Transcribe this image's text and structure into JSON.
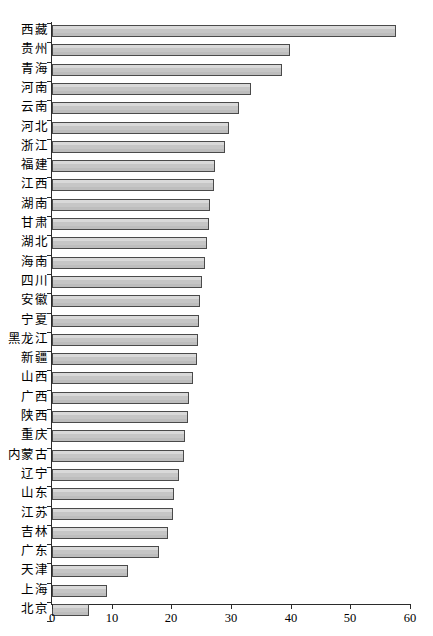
{
  "chart_data": {
    "type": "bar",
    "orientation": "horizontal",
    "title": "",
    "subtitle": "",
    "xlabel": "",
    "ylabel": "",
    "xlim": [
      0,
      60
    ],
    "ylim": null,
    "grid": false,
    "legend": null,
    "xticks": [
      0,
      10,
      20,
      30,
      40,
      50,
      60
    ],
    "xtick_labels": [
      "0",
      "10",
      "20",
      "30",
      "40",
      "50",
      "60"
    ],
    "categories": [
      "西藏",
      "贵州",
      "青海",
      "河南",
      "云南",
      "河北",
      "浙江",
      "福建",
      "江西",
      "湖南",
      "甘肃",
      "湖北",
      "海南",
      "四川",
      "安徽",
      "宁夏",
      "黑龙江",
      "新疆",
      "山西",
      "广西",
      "陕西",
      "重庆",
      "内蒙古",
      "辽宁",
      "山东",
      "江苏",
      "吉林",
      "广东",
      "天津",
      "上海",
      "北京"
    ],
    "values": [
      57.6,
      39.9,
      38.6,
      33.3,
      31.4,
      29.6,
      29.0,
      27.4,
      27.2,
      26.5,
      26.3,
      26.0,
      25.6,
      25.1,
      24.8,
      24.6,
      24.5,
      24.3,
      23.6,
      23.0,
      22.8,
      22.3,
      22.1,
      21.3,
      20.4,
      20.2,
      19.5,
      18.0,
      12.7,
      9.3,
      6.2
    ],
    "bar_fill_color": "#c9c9c9",
    "bar_edge_color": "#4a4a4a"
  },
  "axis": {
    "x_axis_name": "x-axis",
    "y_axis_name": "y-axis"
  }
}
